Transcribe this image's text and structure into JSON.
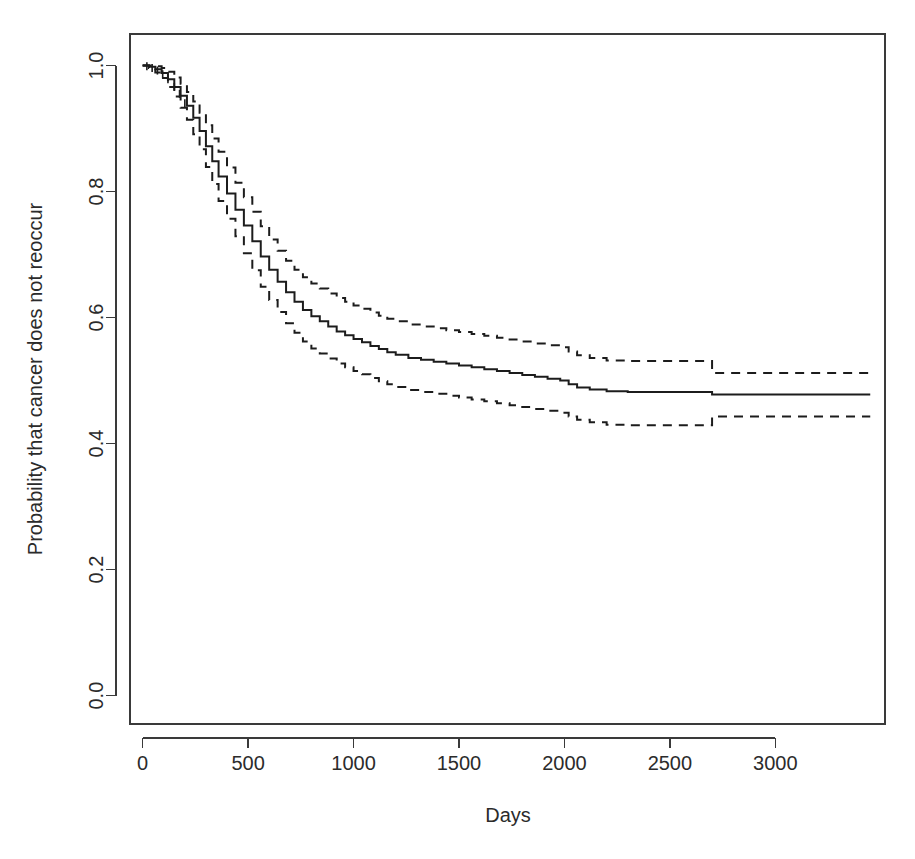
{
  "figure": {
    "background_color": "#ffffff",
    "line_color": "#1c1c1c",
    "axis_color": "#3a3a3a",
    "plot_left_px": 130,
    "plot_right_px": 885,
    "plot_top_px": 34,
    "plot_bottom_px": 724
  },
  "chart_data": {
    "type": "line",
    "title": "",
    "subtitle": "",
    "xlabel": "Days",
    "ylabel": "Probability that cancer does not reoccur",
    "xlim": [
      -60,
      3520
    ],
    "ylim": [
      -0.045,
      1.05
    ],
    "xticks": [
      0,
      500,
      1000,
      1500,
      2000,
      2500,
      3000
    ],
    "xtick_labels": [
      "0",
      "500",
      "1000",
      "1500",
      "2000",
      "2500",
      "3000"
    ],
    "yticks": [
      0.0,
      0.2,
      0.4,
      0.6,
      0.8,
      1.0
    ],
    "ytick_labels": [
      "0.0",
      "0.2",
      "0.4",
      "0.6",
      "0.8",
      "1.0"
    ],
    "grid": false,
    "legend": null,
    "legend_position": "none",
    "annotations": [],
    "series": [
      {
        "name": "Kaplan-Meier survival estimate",
        "style": "solid",
        "linetype": "step",
        "x": [
          0,
          30,
          60,
          90,
          120,
          150,
          180,
          210,
          240,
          270,
          300,
          330,
          360,
          400,
          440,
          480,
          520,
          560,
          600,
          640,
          680,
          720,
          760,
          800,
          840,
          880,
          920,
          960,
          1000,
          1040,
          1080,
          1120,
          1160,
          1200,
          1260,
          1320,
          1380,
          1440,
          1500,
          1560,
          1620,
          1680,
          1740,
          1800,
          1860,
          1920,
          1980,
          2020,
          2060,
          2120,
          2200,
          2300,
          2450,
          2600,
          2700,
          2900,
          3100,
          3300,
          3450
        ],
        "y": [
          1.0,
          0.998,
          0.994,
          0.988,
          0.978,
          0.966,
          0.952,
          0.936,
          0.917,
          0.896,
          0.872,
          0.848,
          0.824,
          0.797,
          0.771,
          0.746,
          0.721,
          0.697,
          0.676,
          0.657,
          0.64,
          0.625,
          0.612,
          0.602,
          0.594,
          0.586,
          0.578,
          0.572,
          0.566,
          0.561,
          0.555,
          0.55,
          0.545,
          0.541,
          0.536,
          0.533,
          0.53,
          0.527,
          0.524,
          0.521,
          0.518,
          0.515,
          0.512,
          0.509,
          0.506,
          0.503,
          0.5,
          0.494,
          0.489,
          0.486,
          0.483,
          0.482,
          0.482,
          0.482,
          0.478,
          0.478,
          0.478,
          0.478,
          0.478
        ]
      },
      {
        "name": "Upper 95% confidence limit",
        "style": "dashed",
        "linetype": "step",
        "x": [
          0,
          30,
          60,
          90,
          120,
          150,
          180,
          210,
          240,
          270,
          300,
          330,
          360,
          400,
          440,
          480,
          520,
          560,
          600,
          640,
          680,
          720,
          760,
          800,
          840,
          880,
          920,
          960,
          1000,
          1040,
          1080,
          1120,
          1160,
          1200,
          1260,
          1320,
          1380,
          1440,
          1500,
          1560,
          1620,
          1680,
          1740,
          1800,
          1860,
          1920,
          1980,
          2020,
          2060,
          2120,
          2200,
          2300,
          2450,
          2600,
          2700,
          2900,
          3100,
          3300,
          3450
        ],
        "y": [
          1.0,
          1.0,
          0.999,
          0.996,
          0.99,
          0.981,
          0.971,
          0.958,
          0.943,
          0.925,
          0.905,
          0.884,
          0.863,
          0.838,
          0.814,
          0.791,
          0.768,
          0.745,
          0.724,
          0.706,
          0.69,
          0.676,
          0.664,
          0.654,
          0.646,
          0.638,
          0.631,
          0.625,
          0.619,
          0.614,
          0.608,
          0.603,
          0.598,
          0.594,
          0.589,
          0.586,
          0.583,
          0.58,
          0.577,
          0.574,
          0.571,
          0.568,
          0.565,
          0.562,
          0.559,
          0.556,
          0.553,
          0.546,
          0.54,
          0.536,
          0.532,
          0.531,
          0.531,
          0.531,
          0.512,
          0.512,
          0.512,
          0.512,
          0.512
        ]
      },
      {
        "name": "Lower 95% confidence limit",
        "style": "dashed",
        "linetype": "step",
        "x": [
          0,
          30,
          60,
          90,
          120,
          150,
          180,
          210,
          240,
          270,
          300,
          330,
          360,
          400,
          440,
          480,
          520,
          560,
          600,
          640,
          680,
          720,
          760,
          800,
          840,
          880,
          920,
          960,
          1000,
          1040,
          1080,
          1120,
          1160,
          1200,
          1260,
          1320,
          1380,
          1440,
          1500,
          1560,
          1620,
          1680,
          1740,
          1800,
          1860,
          1920,
          1980,
          2020,
          2060,
          2120,
          2200,
          2300,
          2450,
          2600,
          2700,
          2900,
          3100,
          3300,
          3450
        ],
        "y": [
          1.0,
          0.996,
          0.989,
          0.98,
          0.966,
          0.951,
          0.933,
          0.914,
          0.891,
          0.867,
          0.839,
          0.812,
          0.785,
          0.757,
          0.729,
          0.702,
          0.675,
          0.649,
          0.628,
          0.609,
          0.591,
          0.576,
          0.562,
          0.551,
          0.543,
          0.535,
          0.527,
          0.521,
          0.515,
          0.51,
          0.504,
          0.499,
          0.494,
          0.49,
          0.485,
          0.482,
          0.479,
          0.476,
          0.473,
          0.47,
          0.467,
          0.464,
          0.461,
          0.458,
          0.455,
          0.452,
          0.449,
          0.443,
          0.438,
          0.434,
          0.43,
          0.429,
          0.429,
          0.429,
          0.443,
          0.443,
          0.443,
          0.443,
          0.443
        ]
      }
    ],
    "censor_marks": {
      "description": "small tick marks on the survival curve near the origin",
      "x": [
        20,
        45,
        70,
        95,
        120,
        150,
        175,
        200
      ],
      "y": [
        0.999,
        0.996,
        0.992,
        0.986,
        0.978,
        0.966,
        0.955,
        0.94
      ]
    },
    "plateau": {
      "estimate": 0.478,
      "upper": 0.512,
      "lower": 0.443
    }
  }
}
